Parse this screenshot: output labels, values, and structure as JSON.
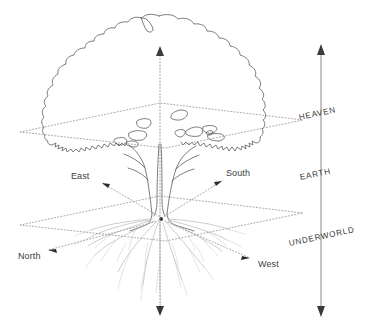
{
  "realms": [
    {
      "id": "heaven",
      "label": "HEAVEN",
      "x": 299,
      "y": 121,
      "rotation": -12
    },
    {
      "id": "earth",
      "label": "EARTH",
      "x": 300,
      "y": 180,
      "rotation": -12
    },
    {
      "id": "underworld",
      "label": "UNDERWORLD",
      "x": 289,
      "y": 244,
      "rotation": -12
    }
  ],
  "directions": [
    {
      "id": "east",
      "label": "East",
      "x": 71,
      "y": 177
    },
    {
      "id": "south",
      "label": "South",
      "x": 226,
      "y": 174
    },
    {
      "id": "north",
      "label": "North",
      "x": 18,
      "y": 256
    },
    {
      "id": "west",
      "label": "West",
      "x": 258,
      "y": 264
    }
  ],
  "axes": {
    "vertical_world_axis": {
      "x": 160,
      "top_y": 48,
      "bottom_y": 314,
      "style": "dotted",
      "arrows": "both"
    },
    "realm_scale_axis": {
      "x": 321,
      "top_y": 46,
      "bottom_y": 314,
      "style": "solid",
      "arrows": "both"
    }
  },
  "planes": [
    {
      "id": "heaven-plane",
      "left_x": 20,
      "right_x": 303,
      "top_y": 103,
      "bottom_y": 148,
      "mid_y": 126
    },
    {
      "id": "earth-plane",
      "left_x": 20,
      "right_x": 303,
      "top_y": 196,
      "bottom_y": 241,
      "mid_y": 219
    }
  ],
  "colors": {
    "background": "#ffffff",
    "tree_outline": "#5b5b63",
    "roots": "#b9bcc2",
    "dotted_guides": "#9a9a9a",
    "solid_axis": "#7d7d7d",
    "text": "#3c3c3c",
    "arrowhead": "#2b2b2b"
  }
}
